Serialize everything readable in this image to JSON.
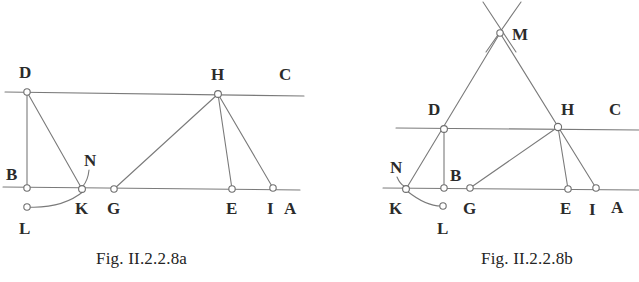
{
  "document": {
    "type": "geometry-figure-pair",
    "background_color": "#ffffff",
    "line_color": "#7a7a7a",
    "label_color": "#2b2b2b",
    "node_fill": "#ffffff"
  },
  "figure_a": {
    "caption": "Fig. II.2.2.8a",
    "labels": {
      "D": "D",
      "H": "H",
      "C": "C",
      "B": "B",
      "N": "N",
      "K": "K",
      "G": "G",
      "E": "E",
      "I": "I",
      "A": "A",
      "L": "L"
    },
    "points": {
      "D": {
        "x": 27,
        "y": 92
      },
      "H": {
        "x": 218,
        "y": 94
      },
      "B": {
        "x": 27,
        "y": 188
      },
      "K": {
        "x": 82,
        "y": 189
      },
      "G": {
        "x": 114,
        "y": 189
      },
      "E": {
        "x": 232,
        "y": 189
      },
      "I": {
        "x": 273,
        "y": 188
      },
      "L": {
        "x": 27,
        "y": 207
      }
    },
    "label_positions": {
      "D": {
        "x": 19,
        "y": 78
      },
      "H": {
        "x": 211,
        "y": 80
      },
      "C": {
        "x": 279,
        "y": 80
      },
      "B": {
        "x": 8,
        "y": 180
      },
      "N": {
        "x": 84,
        "y": 165
      },
      "K": {
        "x": 76,
        "y": 213
      },
      "G": {
        "x": 107,
        "y": 213
      },
      "E": {
        "x": 226,
        "y": 213
      },
      "I": {
        "x": 268,
        "y": 213
      },
      "A": {
        "x": 286,
        "y": 213
      },
      "L": {
        "x": 20,
        "y": 232
      }
    }
  },
  "figure_b": {
    "caption": "Fig. II.2.2.8b",
    "labels": {
      "M": "M",
      "D": "D",
      "H": "H",
      "C": "C",
      "N": "N",
      "B": "B",
      "K": "K",
      "G": "G",
      "E": "E",
      "I": "I",
      "A": "A",
      "L": "L"
    },
    "points": {
      "M": {
        "x": 500,
        "y": 33
      },
      "D": {
        "x": 444,
        "y": 129
      },
      "H": {
        "x": 558,
        "y": 127
      },
      "K": {
        "x": 406,
        "y": 189
      },
      "B": {
        "x": 444,
        "y": 188
      },
      "G": {
        "x": 470,
        "y": 188
      },
      "E": {
        "x": 568,
        "y": 189
      },
      "I": {
        "x": 596,
        "y": 188
      },
      "L": {
        "x": 443,
        "y": 206
      }
    },
    "label_positions": {
      "M": {
        "x": 512,
        "y": 38
      },
      "D": {
        "x": 429,
        "y": 115
      },
      "H": {
        "x": 560,
        "y": 115
      },
      "C": {
        "x": 610,
        "y": 115
      },
      "N": {
        "x": 392,
        "y": 172
      },
      "B": {
        "x": 449,
        "y": 180
      },
      "K": {
        "x": 391,
        "y": 212
      },
      "G": {
        "x": 464,
        "y": 213
      },
      "E": {
        "x": 561,
        "y": 213
      },
      "I": {
        "x": 589,
        "y": 214
      },
      "A": {
        "x": 613,
        "y": 212
      }
    }
  }
}
